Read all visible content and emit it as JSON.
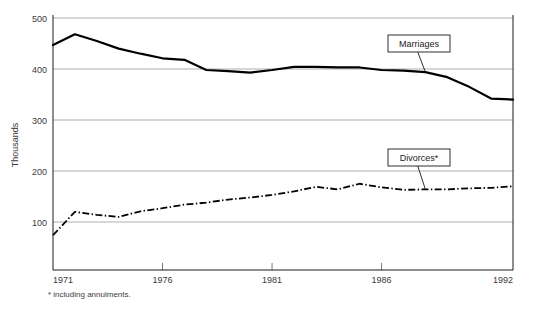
{
  "chart_data": {
    "type": "line",
    "title": "",
    "xlabel": "",
    "ylabel": "Thousands",
    "footnote": "* including annulments.",
    "xlim": [
      1971,
      1992
    ],
    "ylim": [
      0,
      500
    ],
    "grid": true,
    "legend_position": "inline-callouts",
    "x": [
      1971,
      1972,
      1973,
      1974,
      1975,
      1976,
      1977,
      1978,
      1979,
      1980,
      1981,
      1982,
      1983,
      1984,
      1985,
      1986,
      1987,
      1988,
      1989,
      1990,
      1991,
      1992
    ],
    "x_ticks": [
      1971,
      1976,
      1981,
      1986,
      1992
    ],
    "x_tick_labels": [
      "1971",
      "1976",
      "1981",
      "1986",
      "1992"
    ],
    "y_ticks": [
      100,
      200,
      300,
      400,
      500
    ],
    "y_tick_labels": [
      "100",
      "200",
      "300",
      "400",
      "500"
    ],
    "series": [
      {
        "name": "Marriages",
        "style": "solid",
        "values": [
          447,
          468,
          455,
          440,
          430,
          421,
          418,
          398,
          396,
          393,
          398,
          404,
          404,
          403,
          403,
          398,
          397,
          394,
          384,
          365,
          342,
          340
        ]
      },
      {
        "name": "Divorces*",
        "style": "dash-dot",
        "values": [
          74,
          120,
          114,
          110,
          121,
          127,
          134,
          138,
          144,
          148,
          153,
          160,
          169,
          164,
          175,
          168,
          163,
          164,
          164,
          166,
          167,
          170
        ]
      }
    ],
    "annotations": [
      {
        "label": "Marriages",
        "series": "Marriages",
        "anchor_x": 1988,
        "anchor_y": 394
      },
      {
        "label": "Divorces*",
        "series": "Divorces*",
        "anchor_x": 1988,
        "anchor_y": 164
      }
    ]
  }
}
